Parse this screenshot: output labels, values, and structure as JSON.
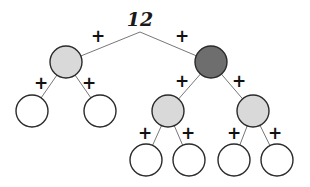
{
  "diagram": {
    "type": "tree",
    "root": {
      "label": "12",
      "x": 140,
      "y": 26
    },
    "colors": {
      "light": "#d9d9d9",
      "dark": "#6e6e6e",
      "leaf": "#ffffff",
      "stroke": "#2a2a2a",
      "edge": "#777777"
    },
    "nodes": [
      {
        "id": "n1",
        "x": 66,
        "y": 62,
        "r": 16,
        "fill": "light"
      },
      {
        "id": "n2",
        "x": 211,
        "y": 62,
        "r": 16,
        "fill": "dark"
      },
      {
        "id": "n3",
        "x": 32,
        "y": 111,
        "r": 16,
        "fill": "leaf"
      },
      {
        "id": "n4",
        "x": 100,
        "y": 111,
        "r": 16,
        "fill": "leaf"
      },
      {
        "id": "n5",
        "x": 168,
        "y": 111,
        "r": 16,
        "fill": "light"
      },
      {
        "id": "n6",
        "x": 253,
        "y": 111,
        "r": 16,
        "fill": "light"
      },
      {
        "id": "n7",
        "x": 146,
        "y": 160,
        "r": 16,
        "fill": "leaf"
      },
      {
        "id": "n8",
        "x": 189,
        "y": 160,
        "r": 16,
        "fill": "leaf"
      },
      {
        "id": "n9",
        "x": 234,
        "y": 160,
        "r": 16,
        "fill": "leaf"
      },
      {
        "id": "n10",
        "x": 277,
        "y": 160,
        "r": 16,
        "fill": "leaf"
      }
    ],
    "edges": [
      {
        "from": "root",
        "to": "n1",
        "label": "+",
        "lx": 98,
        "ly": 42
      },
      {
        "from": "root",
        "to": "n2",
        "label": "+",
        "lx": 182,
        "ly": 42
      },
      {
        "from": "n1",
        "to": "n3",
        "label": "+",
        "lx": 41,
        "ly": 89
      },
      {
        "from": "n1",
        "to": "n4",
        "label": "+",
        "lx": 89,
        "ly": 89
      },
      {
        "from": "n2",
        "to": "n5",
        "label": "+",
        "lx": 182,
        "ly": 87
      },
      {
        "from": "n2",
        "to": "n6",
        "label": "+",
        "lx": 239,
        "ly": 87
      },
      {
        "from": "n5",
        "to": "n7",
        "label": "+",
        "lx": 145,
        "ly": 139
      },
      {
        "from": "n5",
        "to": "n8",
        "label": "+",
        "lx": 188,
        "ly": 139
      },
      {
        "from": "n6",
        "to": "n9",
        "label": "+",
        "lx": 234,
        "ly": 139
      },
      {
        "from": "n6",
        "to": "n10",
        "label": "+",
        "lx": 275,
        "ly": 139
      }
    ]
  }
}
